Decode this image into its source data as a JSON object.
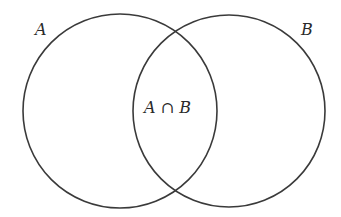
{
  "diagram": {
    "type": "venn",
    "stroke_color": "#3a3a3a",
    "text_color": "#2a2a2a",
    "sets": [
      {
        "id": "A",
        "label": "A",
        "cx": 120,
        "cy": 111,
        "r": 97
      },
      {
        "id": "B",
        "label": "B",
        "cx": 229,
        "cy": 111,
        "r": 96
      }
    ],
    "intersection": {
      "label": "A ∩ B"
    }
  }
}
